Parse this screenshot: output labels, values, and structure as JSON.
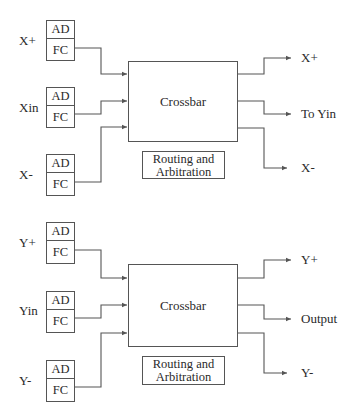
{
  "diagram": {
    "type": "router-block-diagram",
    "stages": [
      {
        "name": "x-dimension",
        "inputs": [
          {
            "label": "X+",
            "buffer": {
              "top": "AD",
              "bottom": "FC"
            }
          },
          {
            "label": "Xin",
            "buffer": {
              "top": "AD",
              "bottom": "FC"
            }
          },
          {
            "label": "X-",
            "buffer": {
              "top": "AD",
              "bottom": "FC"
            }
          }
        ],
        "switch_label": "Crossbar",
        "control_label": [
          "Routing and",
          "Arbitration"
        ],
        "outputs": [
          "X+",
          "To Yin",
          "X-"
        ]
      },
      {
        "name": "y-dimension",
        "inputs": [
          {
            "label": "Y+",
            "buffer": {
              "top": "AD",
              "bottom": "FC"
            }
          },
          {
            "label": "Yin",
            "buffer": {
              "top": "AD",
              "bottom": "FC"
            }
          },
          {
            "label": "Y-",
            "buffer": {
              "top": "AD",
              "bottom": "FC"
            }
          }
        ],
        "switch_label": "Crossbar",
        "control_label": [
          "Routing and",
          "Arbitration"
        ],
        "outputs": [
          "Y+",
          "Output",
          "Y-"
        ]
      }
    ],
    "colors": {
      "line": "#555555",
      "text": "#2a2a2a",
      "background": "#ffffff"
    }
  }
}
